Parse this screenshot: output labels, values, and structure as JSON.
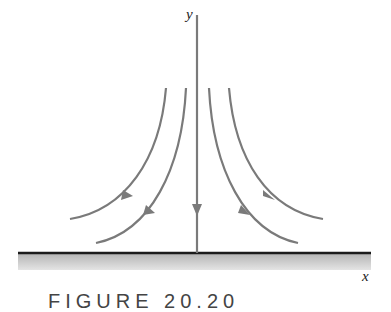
{
  "figure": {
    "axis_labels": {
      "x": "x",
      "y": "y"
    },
    "caption": "FIGURE 20.20",
    "colors": {
      "streamline": "#7a7a7a",
      "wall_line": "#1a1a1a",
      "wall_shading": "#bdbdbd"
    },
    "streamlines": [
      {
        "id": "outer-left",
        "direction": "down-left"
      },
      {
        "id": "inner-left",
        "direction": "down-left"
      },
      {
        "id": "center",
        "direction": "down"
      },
      {
        "id": "inner-right",
        "direction": "down-right"
      },
      {
        "id": "outer-right",
        "direction": "down-right"
      }
    ]
  }
}
